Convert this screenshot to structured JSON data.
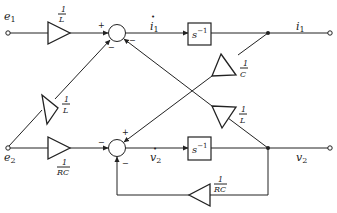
{
  "diagram": {
    "type": "signal-flow block diagram",
    "inputs": [
      {
        "id": "e1",
        "label": "e",
        "sub": "1"
      },
      {
        "id": "e2",
        "label": "e",
        "sub": "2"
      }
    ],
    "outputs": [
      {
        "id": "i1",
        "label": "i",
        "sub": "1"
      },
      {
        "id": "v2",
        "label": "v",
        "sub": "2"
      }
    ],
    "derivatives": [
      {
        "id": "i1dot",
        "label": "i",
        "sub": "1",
        "dot": "•"
      },
      {
        "id": "v2dot",
        "label": "v",
        "sub": "2",
        "dot": "•"
      }
    ],
    "gains": {
      "top_input": {
        "num": "1",
        "den": "L"
      },
      "bottom_input": {
        "num": "1",
        "den": "RC"
      },
      "diag_e2": {
        "num": "1",
        "den": "L"
      },
      "cross_c": {
        "num": "1",
        "den": "C"
      },
      "cross_l": {
        "num": "1",
        "den": "L"
      },
      "feedback": {
        "num": "1",
        "den": "RC"
      }
    },
    "integrators": [
      {
        "id": "int1",
        "label": "s",
        "exp": "−1"
      },
      {
        "id": "int2",
        "label": "s",
        "exp": "−1"
      }
    ],
    "summing_signs": {
      "top_plus": "+",
      "top_minus_left": "−",
      "top_minus_right": "−",
      "bot_plus": "+",
      "bot_minus_left": "−",
      "bot_minus_bottom": "−"
    }
  }
}
